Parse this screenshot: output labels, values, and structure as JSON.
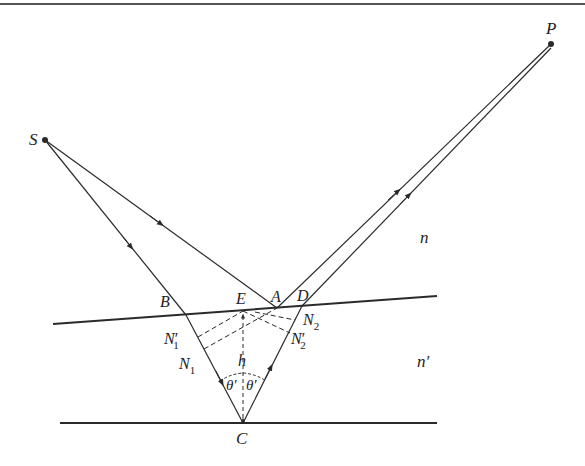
{
  "diagram": {
    "points": {
      "S": {
        "label": "S",
        "x": 45,
        "y": 140
      },
      "P": {
        "label": "P",
        "x": 551,
        "y": 44
      },
      "A": {
        "label": "A",
        "x": 277,
        "y": 308
      },
      "B": {
        "label": "B",
        "x": 186,
        "y": 315
      },
      "C": {
        "label": "C",
        "x": 243,
        "y": 423
      },
      "D": {
        "label": "D",
        "x": 302,
        "y": 306
      },
      "E": {
        "label": "E",
        "x": 243,
        "y": 311
      }
    },
    "labels": {
      "S": "S",
      "P": "P",
      "A": "A",
      "B": "B",
      "C": "C",
      "D": "D",
      "E": "E",
      "N1": "N",
      "N1_sub": "1",
      "N1p": "N",
      "N1p_sub": "1",
      "N1p_prime": "′",
      "N2": "N",
      "N2_sub": "2",
      "N2p": "N",
      "N2p_sub": "2",
      "N2p_prime": "′",
      "h": "h",
      "theta_left": "θ′",
      "theta_right": "θ′",
      "medium_top": "n",
      "medium_bottom": "n′"
    },
    "colors": {
      "line": "#2a2a2a",
      "background": "#ffffff"
    }
  }
}
